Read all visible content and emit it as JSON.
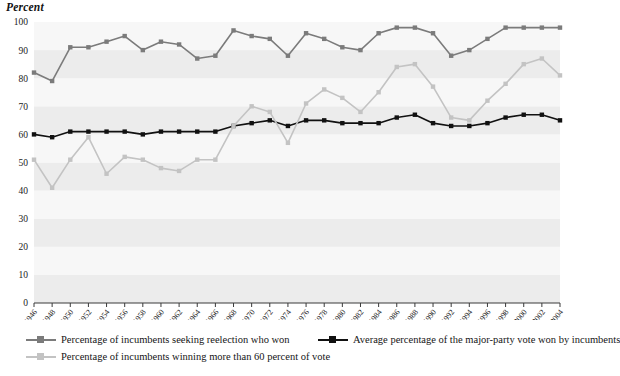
{
  "figure": {
    "y_axis_title": "Percent"
  },
  "legend": {
    "position": "below-plot",
    "entries": [
      {
        "name": "seeking-reelection-who-won",
        "label": "Percentage of incumbents seeking reelection who won",
        "color": "#7b7b7b"
      },
      {
        "name": "major-party-vote-won",
        "label": "Average percentage of the major-party vote won by incumbents",
        "color": "#111111"
      },
      {
        "name": "winning-more-than-60-percent",
        "label": "Percentage of incumbents winning more than 60 percent of vote",
        "color": "#c3c3c3"
      }
    ]
  },
  "chart_data": {
    "type": "line",
    "title": "",
    "subtitle": "",
    "xlabel": "",
    "ylabel": "Percent",
    "ylim": [
      0,
      100
    ],
    "ytick_step": 10,
    "yticks": [
      0,
      10,
      20,
      30,
      40,
      50,
      60,
      70,
      80,
      90,
      100
    ],
    "grid": false,
    "band_shading": "alternating horizontal bands every 10 percent",
    "x": [
      1946,
      1948,
      1950,
      1952,
      1954,
      1956,
      1958,
      1960,
      1962,
      1964,
      1966,
      1968,
      1970,
      1972,
      1974,
      1976,
      1978,
      1980,
      1982,
      1984,
      1986,
      1988,
      1990,
      1992,
      1994,
      1996,
      1998,
      2000,
      2002,
      2004
    ],
    "xtick_labels": [
      "1946",
      "1948",
      "1950",
      "1952",
      "1954",
      "1956",
      "1958",
      "1960",
      "1962",
      "1964",
      "1966",
      "1968",
      "1970",
      "1972",
      "1974",
      "1976",
      "1978",
      "1980",
      "1982",
      "1984",
      "1986",
      "1988",
      "1990",
      "1992",
      "1994",
      "1996",
      "1998",
      "2000",
      "2002",
      "2004"
    ],
    "series": [
      {
        "name": "Percentage of incumbents seeking reelection who won",
        "color": "#7b7b7b",
        "marker": "square",
        "values": [
          82,
          79,
          91,
          91,
          93,
          95,
          90,
          93,
          92,
          87,
          88,
          97,
          95,
          94,
          88,
          96,
          94,
          91,
          90,
          96,
          98,
          98,
          96,
          88,
          90,
          94,
          98,
          98,
          98,
          98
        ]
      },
      {
        "name": "Average percentage of the major-party vote won by incumbents",
        "color": "#111111",
        "marker": "square",
        "values": [
          60,
          59,
          61,
          61,
          61,
          61,
          60,
          61,
          61,
          61,
          61,
          63,
          64,
          65,
          63,
          65,
          65,
          64,
          64,
          64,
          66,
          67,
          64,
          63,
          63,
          64,
          66,
          67,
          67,
          65
        ]
      },
      {
        "name": "Percentage of incumbents winning more than 60 percent of vote",
        "color": "#c3c3c3",
        "marker": "square",
        "values": [
          51,
          41,
          51,
          59,
          46,
          52,
          51,
          48,
          47,
          51,
          51,
          63,
          70,
          68,
          57,
          71,
          76,
          73,
          68,
          75,
          84,
          85,
          77,
          66,
          65,
          72,
          78,
          85,
          87,
          81
        ]
      }
    ]
  }
}
